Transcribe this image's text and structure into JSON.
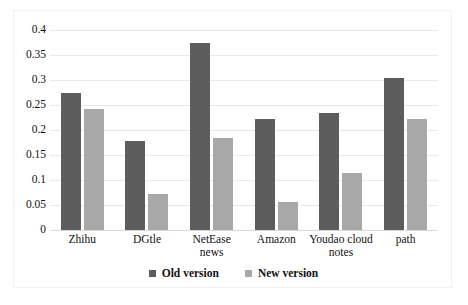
{
  "chart_data": {
    "type": "bar",
    "title": "",
    "xlabel": "",
    "ylabel": "",
    "ylim": [
      0,
      0.4
    ],
    "ytick_labels": [
      "0.4",
      "0.35",
      "0.3",
      "0.25",
      "0.2",
      "0.15",
      "0.1",
      "0.05",
      "0"
    ],
    "ytick_values": [
      0.4,
      0.35,
      0.3,
      0.25,
      0.2,
      0.15,
      0.1,
      0.05,
      0
    ],
    "grid": true,
    "legend_position": "bottom",
    "categories": [
      "Zhihu",
      "DGtle",
      "NetEase news",
      "Amazon",
      "Youdao cloud notes",
      "path"
    ],
    "series": [
      {
        "name": "Old version",
        "color": "#5d5d5d",
        "values": [
          0.275,
          0.178,
          0.375,
          0.223,
          0.235,
          0.305
        ]
      },
      {
        "name": "New version",
        "color": "#a8a8a8",
        "values": [
          0.243,
          0.072,
          0.185,
          0.057,
          0.115,
          0.222
        ]
      }
    ]
  },
  "legend": {
    "items": [
      {
        "label": "Old version",
        "color": "#5d5d5d"
      },
      {
        "label": "New version",
        "color": "#a8a8a8"
      }
    ]
  }
}
